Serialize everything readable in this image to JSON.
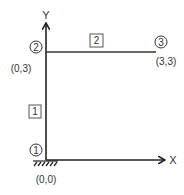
{
  "diagram": {
    "type": "frame-structure",
    "axes": {
      "x_label": "X",
      "y_label": "Y"
    },
    "nodes": [
      {
        "id": "1",
        "label": "1",
        "coord_label": "(0,0)"
      },
      {
        "id": "2",
        "label": "2",
        "coord_label": "(0,3)"
      },
      {
        "id": "3",
        "label": "3",
        "coord_label": "(3,3)"
      }
    ],
    "elements": [
      {
        "id": "1",
        "label": "1",
        "from": "1",
        "to": "2"
      },
      {
        "id": "2",
        "label": "2",
        "from": "2",
        "to": "3"
      }
    ],
    "support": {
      "node": "1",
      "type": "fixed"
    },
    "colors": {
      "line": "#222222",
      "text": "#333333",
      "box": "#555555"
    }
  }
}
